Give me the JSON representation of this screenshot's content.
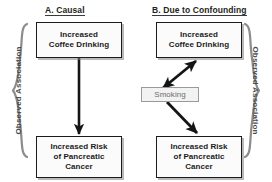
{
  "figure": {
    "background_color": "#ffffff",
    "box_border_color": "#1b1b1b",
    "confounder_color": "#6d6d6d",
    "brace_color": "#8c8c8c",
    "arrow_color": "#151515"
  },
  "panels": [
    {
      "id": "a",
      "title": "A. Causal",
      "nodes": [
        {
          "id": "a-cause",
          "label": "Increased\nCoffee Drinking"
        },
        {
          "id": "a-effect",
          "label": "Increased Risk\nof Pancreatic\nCancer"
        }
      ],
      "arrows": [
        {
          "from": "a-cause",
          "to": "a-effect",
          "heads": 1,
          "direction": "down"
        }
      ]
    },
    {
      "id": "b",
      "title": "B. Due to Confounding",
      "nodes": [
        {
          "id": "b-cause",
          "label": "Increased\nCoffee Drinking"
        },
        {
          "id": "b-effect",
          "label": "Increased Risk\nof Pancreatic\nCancer"
        },
        {
          "id": "b-confounder",
          "label": "Smoking"
        }
      ],
      "arrows": [
        {
          "from": "b-confounder",
          "to": "b-cause",
          "heads": 2,
          "direction": "up-right"
        },
        {
          "from": "b-confounder",
          "to": "b-effect",
          "heads": 1,
          "direction": "down-right"
        }
      ]
    }
  ],
  "braces": {
    "left": {
      "label": "Observed Association",
      "side": "left"
    },
    "right": {
      "label": "Observed Association",
      "side": "right"
    }
  }
}
